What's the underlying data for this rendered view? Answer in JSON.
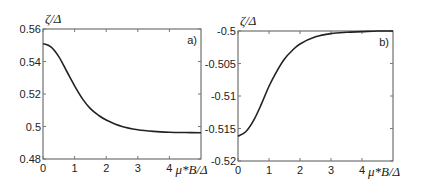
{
  "chart_data": [
    {
      "type": "line",
      "panel_label": "a)",
      "title": "",
      "xlabel": "μ*B/Δ",
      "ylabel": "ζ/Δ",
      "xlim": [
        0,
        5
      ],
      "ylim": [
        0.48,
        0.56
      ],
      "x_ticks": [
        "0",
        "1",
        "2",
        "3",
        "4"
      ],
      "y_ticks": [
        "0.48",
        "0.5",
        "0.52",
        "0.54",
        "0.56"
      ],
      "grid": false,
      "series": [
        {
          "name": "ζ/Δ",
          "x": [
            0,
            0.25,
            0.5,
            0.75,
            1.0,
            1.25,
            1.5,
            1.75,
            2.0,
            2.5,
            3.0,
            3.5,
            4.0,
            4.5,
            5.0
          ],
          "values": [
            0.551,
            0.549,
            0.543,
            0.534,
            0.525,
            0.517,
            0.511,
            0.507,
            0.504,
            0.5,
            0.498,
            0.497,
            0.4965,
            0.4963,
            0.4962
          ]
        }
      ]
    },
    {
      "type": "line",
      "panel_label": "b)",
      "title": "",
      "xlabel": "μ*B/Δ",
      "ylabel": "ζ/Δ",
      "xlim": [
        0,
        5
      ],
      "ylim": [
        -0.52,
        -0.5
      ],
      "x_ticks": [
        "0",
        "1",
        "2",
        "3",
        "4"
      ],
      "y_ticks": [
        "-0.52",
        "-0.515",
        "-0.51",
        "-0.505",
        "-0.5"
      ],
      "grid": false,
      "series": [
        {
          "name": "ζ/Δ",
          "x": [
            0,
            0.25,
            0.5,
            0.75,
            1.0,
            1.25,
            1.5,
            1.75,
            2.0,
            2.5,
            3.0,
            3.5,
            4.0,
            4.5,
            5.0
          ],
          "values": [
            -0.5162,
            -0.5155,
            -0.5138,
            -0.5113,
            -0.5085,
            -0.5062,
            -0.5043,
            -0.503,
            -0.502,
            -0.5009,
            -0.5004,
            -0.5002,
            -0.5001,
            -0.5,
            -0.5
          ]
        }
      ]
    }
  ]
}
